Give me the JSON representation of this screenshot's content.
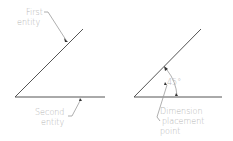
{
  "diagram": {
    "left": {
      "first_entity_label": [
        "First",
        "entity"
      ],
      "second_entity_label": [
        "Second",
        "entity"
      ]
    },
    "right": {
      "angle_label": "45°",
      "placement_label": [
        "Dimension",
        "placement",
        "point"
      ]
    },
    "colors": {
      "line": "#555555",
      "text": "#b5b5b5",
      "leader": "#9a9a9a",
      "background": "#ffffff"
    }
  }
}
